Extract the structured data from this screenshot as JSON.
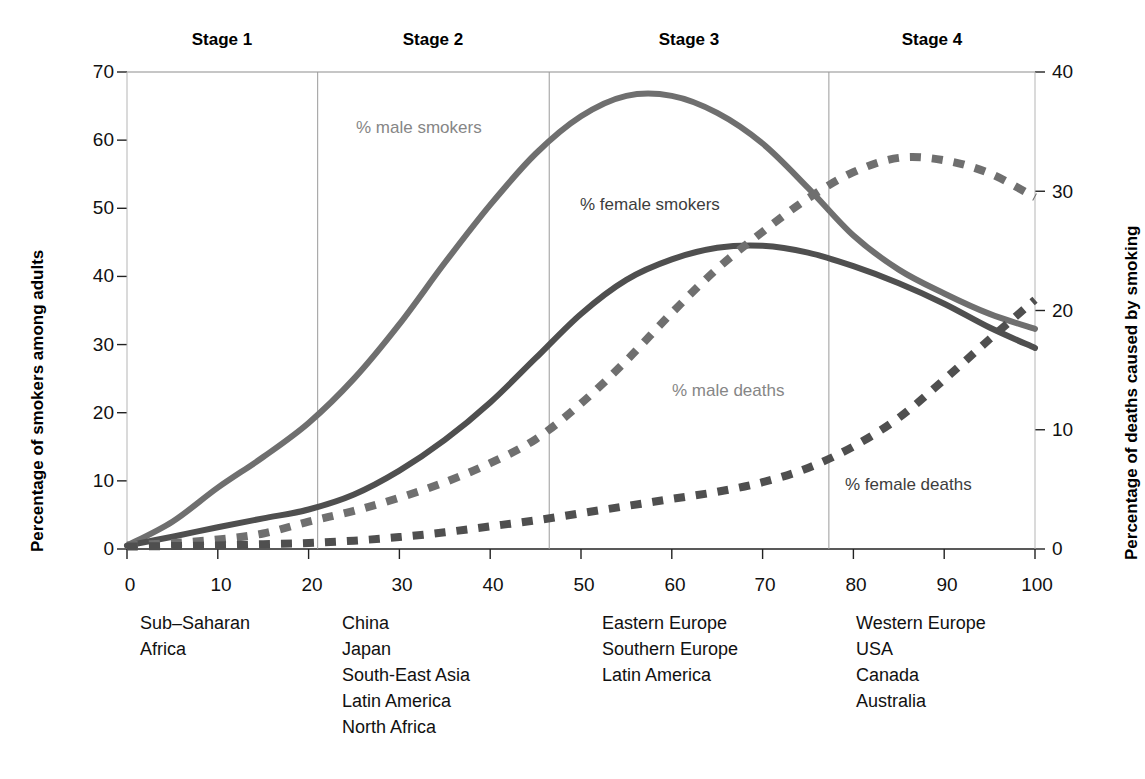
{
  "stages": [
    {
      "name": "Stage 1",
      "label": "Stage 1",
      "x_center": 222,
      "divider_x": null
    },
    {
      "name": "Stage 2",
      "label": "Stage 2",
      "x_center": 433,
      "divider_x": 318
    },
    {
      "name": "Stage 3",
      "label": "Stage 3",
      "x_center": 689,
      "divider_x": 549
    },
    {
      "name": "Stage 4",
      "label": "Stage 4",
      "x_center": 932,
      "divider_x": 829
    }
  ],
  "axes": {
    "left_title": "Percentage of smokers among adults",
    "right_title": "Percentage of deaths caused by smoking",
    "left_ticks": [
      "0",
      "10",
      "20",
      "30",
      "40",
      "50",
      "60",
      "70"
    ],
    "right_ticks": [
      "0",
      "10",
      "20",
      "30",
      "40"
    ],
    "x_ticks": [
      "0",
      "10",
      "20",
      "30",
      "40",
      "50",
      "60",
      "70",
      "80",
      "90",
      "100"
    ]
  },
  "series_labels": {
    "male_smokers": "% male smokers",
    "female_smokers": "% female smokers",
    "male_deaths": "% male deaths",
    "female_deaths": "% female deaths"
  },
  "region_groups": [
    {
      "stage": "Stage 1",
      "items": [
        "Sub–Saharan",
        "Africa"
      ]
    },
    {
      "stage": "Stage 2",
      "items": [
        "China",
        "Japan",
        "South-East Asia",
        "Latin America",
        "North Africa"
      ]
    },
    {
      "stage": "Stage 3",
      "items": [
        "Eastern Europe",
        "Southern Europe",
        "Latin America"
      ]
    },
    {
      "stage": "Stage 4",
      "items": [
        "Western Europe",
        "USA",
        "Canada",
        "Australia"
      ]
    }
  ],
  "colors": {
    "male_smokers": "#6f6f6f",
    "female_smokers": "#4f4f4f",
    "male_deaths": "#6f6f6f",
    "female_deaths": "#4f4f4f",
    "axis": "#111111",
    "divider": "#9a9a9a",
    "background": "#ffffff"
  },
  "chart_data": {
    "type": "line",
    "title": "",
    "xlabel": "",
    "ylabel": "Percentage of smokers among adults",
    "y2label": "Percentage of deaths caused by smoking",
    "xlim": [
      0,
      100
    ],
    "ylim": [
      0,
      70
    ],
    "y2lim": [
      0,
      40
    ],
    "grid": false,
    "legend": "inline annotations",
    "stage_dividers_x": [
      21,
      46.5,
      77.3
    ],
    "x": [
      0,
      5,
      10,
      15,
      20,
      25,
      30,
      35,
      40,
      45,
      50,
      55,
      60,
      65,
      70,
      75,
      80,
      85,
      90,
      95,
      100
    ],
    "series": [
      {
        "name": "% male smokers",
        "axis": "left",
        "style": "solid",
        "values": [
          0.5,
          4,
          9,
          13.5,
          18.5,
          25,
          33,
          42,
          50.5,
          58,
          63.5,
          66.5,
          66.5,
          64,
          59.5,
          53,
          46,
          41,
          37.5,
          34.5,
          32.3
        ]
      },
      {
        "name": "% female smokers",
        "axis": "left",
        "style": "solid",
        "values": [
          0.5,
          1.8,
          3.2,
          4.5,
          5.8,
          8,
          11.5,
          16,
          21.5,
          28,
          34.5,
          39.5,
          42.5,
          44.2,
          44.5,
          43.5,
          41.5,
          39,
          36,
          32.5,
          29.5
        ]
      },
      {
        "name": "% male deaths",
        "axis": "right",
        "style": "dashed",
        "values": [
          0.3,
          0.5,
          0.8,
          1.3,
          2.3,
          3.2,
          4.3,
          5.6,
          7.2,
          9.2,
          12.2,
          15.8,
          19.8,
          23.5,
          26.6,
          29.4,
          31.6,
          32.8,
          32.6,
          31.5,
          29.5
        ]
      },
      {
        "name": "% female deaths",
        "axis": "right",
        "style": "dashed",
        "values": [
          0.2,
          0.25,
          0.3,
          0.4,
          0.5,
          0.7,
          1.0,
          1.4,
          1.9,
          2.4,
          3.0,
          3.6,
          4.2,
          4.8,
          5.6,
          6.8,
          8.6,
          11.0,
          14.2,
          17.6,
          20.9
        ]
      }
    ]
  }
}
